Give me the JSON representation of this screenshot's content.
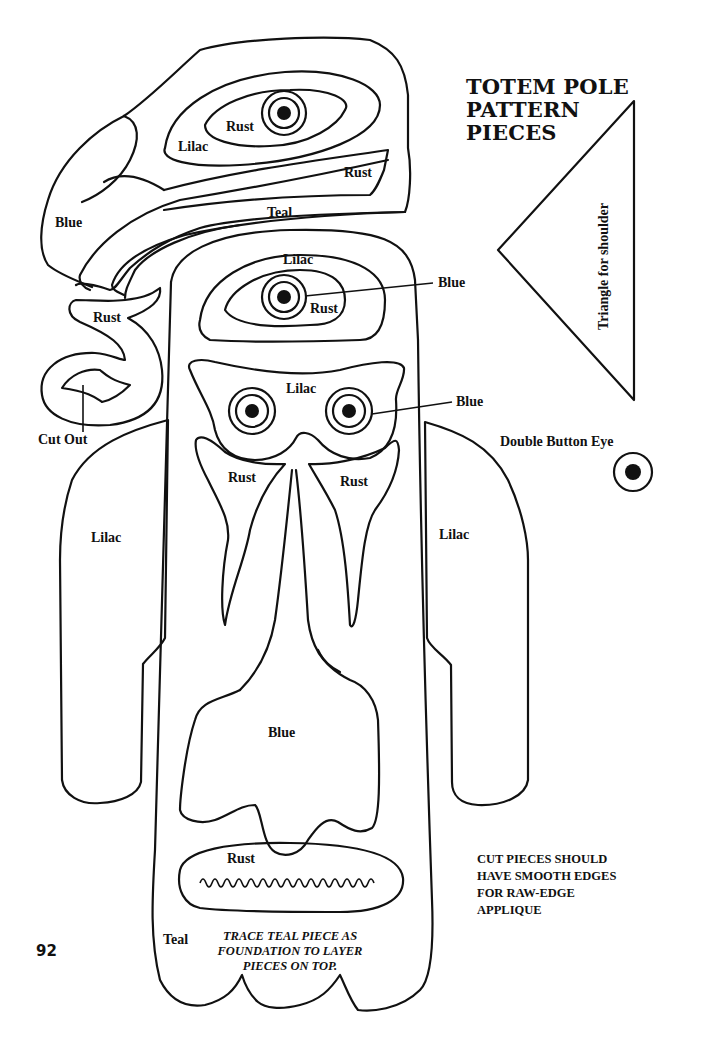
{
  "title": {
    "line1": "TOTEM POLE",
    "line2": "PATTERN",
    "line3": "PIECES"
  },
  "labels": {
    "bird_eye_rust": "Rust",
    "bird_lilac": "Lilac",
    "bird_beak_rust": "Rust",
    "bird_blue": "Blue",
    "bird_teal": "Teal",
    "upper_face_lilac": "Lilac",
    "upper_face_rust": "Rust",
    "upper_eye_callout": "Blue",
    "hook_rust": "Rust",
    "cut_out": "Cut Out",
    "mask_lilac": "Lilac",
    "mask_eye_callout": "Blue",
    "cheek_left_rust": "Rust",
    "cheek_right_rust": "Rust",
    "left_arm_lilac": "Lilac",
    "right_arm_lilac": "Lilac",
    "body_blue": "Blue",
    "mouth_rust": "Rust",
    "base_teal": "Teal",
    "triangle": "Triangle for shoulder",
    "double_button_eye": "Double Button Eye"
  },
  "notes": {
    "smooth_edges": [
      "CUT PIECES SHOULD",
      "HAVE SMOOTH EDGES",
      "FOR RAW-EDGE",
      "APPLIQUE"
    ],
    "trace_teal": [
      "TRACE TEAL PIECE AS",
      "FOUNDATION TO LAYER",
      "PIECES ON TOP."
    ]
  },
  "page_number": "92"
}
